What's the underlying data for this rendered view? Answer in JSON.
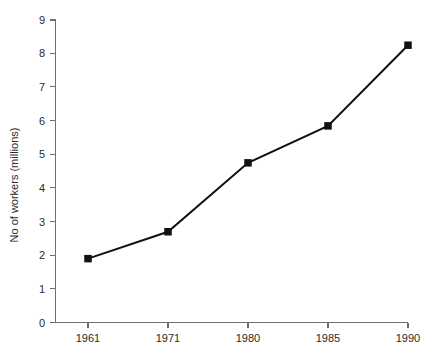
{
  "chart_data": {
    "type": "line",
    "title": "",
    "subtitle": "",
    "xlabel": "",
    "ylabel": "No of workers (millions)",
    "categories": [
      "1961",
      "1971",
      "1980",
      "1985",
      "1990"
    ],
    "values": [
      1.9,
      2.7,
      4.75,
      5.85,
      8.25
    ],
    "series": [
      {
        "name": "No of workers",
        "values": [
          1.9,
          2.7,
          4.75,
          5.85,
          8.25
        ]
      }
    ],
    "ylim": [
      0,
      9
    ],
    "yticks": [
      0,
      1,
      2,
      3,
      4,
      5,
      6,
      7,
      8,
      9
    ],
    "ytick_labels": [
      "0",
      "1",
      "2",
      "3",
      "4",
      "5",
      "6",
      "7",
      "8",
      "9"
    ],
    "xtick_labels": [
      "1961",
      "1971",
      "1980",
      "1985",
      "1990"
    ],
    "grid": false,
    "legend": false,
    "legend_position": "none",
    "marker": "square",
    "line_color": "#111111",
    "marker_color": "#111111",
    "axis_color": "#6f6f6f",
    "background_color": "#ffffff",
    "annotations": []
  }
}
